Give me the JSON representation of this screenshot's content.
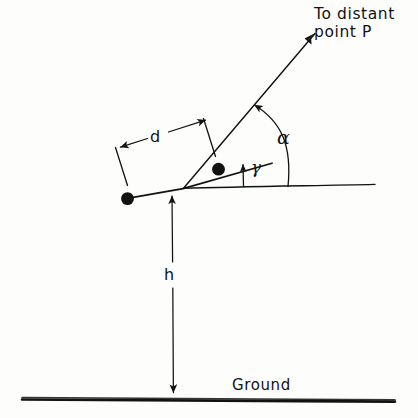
{
  "diagram": {
    "background_color": "#fdfdfc",
    "ink_color": "#121212",
    "labels": {
      "destination_line1": "To distant",
      "destination_line2": "point P",
      "ground": "Ground",
      "baseline_distance": "d",
      "height": "h",
      "angle_alpha": "α",
      "angle_gamma": "γ"
    },
    "elements": {
      "ray_to_point": "arrow-to-distant-point-p",
      "alpha_arc": "angle-arc-alpha",
      "gamma_arrow": "angle-indicator-gamma",
      "d_dimension": "dimension-line-d",
      "h_dimension": "dimension-line-h",
      "ground_line": "ground-line",
      "horizontal_reference": "horizontal-reference-line",
      "instrument_line": "sloped-instrument-line",
      "marker_near": "station-marker-near",
      "marker_far": "station-marker-far"
    }
  }
}
